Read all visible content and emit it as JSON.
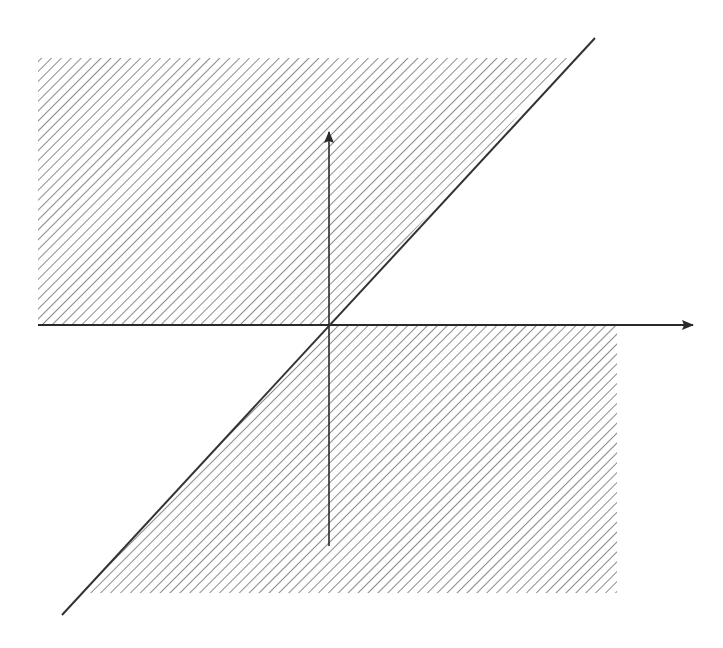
{
  "diagram": {
    "colors": {
      "background": "#ffffff",
      "hatch": "#6e6e6e",
      "axis": "#2a2a2a",
      "line": "#333333"
    },
    "hatch_spacing_px": 7,
    "origin": {
      "x": 329,
      "y": 325
    },
    "x_axis": {
      "x1": 38,
      "y": 325,
      "x2": 693,
      "arrow": true
    },
    "y_axis": {
      "x": 329,
      "y1": 546,
      "y2": 132,
      "arrow": true
    },
    "diagonal_line": {
      "x1": 62,
      "y1": 615,
      "x2": 595,
      "y2": 38
    },
    "regions": [
      {
        "name": "upper-hatched-region",
        "points": "38,58 570,58 329,325 38,325"
      },
      {
        "name": "lower-hatched-region",
        "points": "329,325 617,325 617,593 82,593"
      }
    ]
  }
}
